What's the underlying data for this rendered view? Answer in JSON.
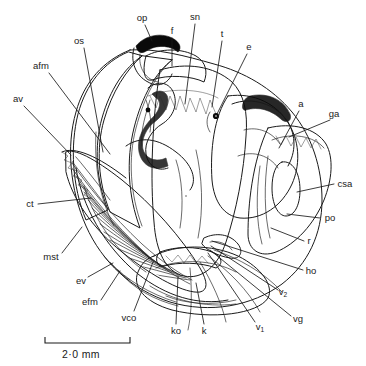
{
  "figure": {
    "background_color": "#ffffff",
    "ink_color": "#1a1a1a",
    "width": 366,
    "height": 366
  },
  "scale_bar": {
    "label": "2·0 mm",
    "x_start": 45,
    "x_end": 130,
    "y": 343,
    "tick_height": 6,
    "text_x": 62,
    "text_y": 358
  },
  "labels": [
    {
      "id": "op",
      "text": "op",
      "x": 142,
      "y": 18,
      "anchor": "middle",
      "leader": "M 145 25 L 152 41"
    },
    {
      "id": "f",
      "text": "f",
      "x": 172,
      "y": 31,
      "anchor": "middle",
      "leader": "M 172 38 L 172 66"
    },
    {
      "id": "sn",
      "text": "sn",
      "x": 195,
      "y": 17,
      "anchor": "middle",
      "leader": "M 195 24 L 185 104"
    },
    {
      "id": "t",
      "text": "t",
      "x": 222,
      "y": 34,
      "anchor": "middle",
      "leader": "M 222 41 L 212 107"
    },
    {
      "id": "e",
      "text": "e",
      "x": 249,
      "y": 47,
      "anchor": "middle",
      "leader": "M 247 54 L 217 114"
    },
    {
      "id": "os",
      "text": "os",
      "x": 79,
      "y": 41,
      "anchor": "middle",
      "leader": "M 84 48 L 103 152"
    },
    {
      "id": "afm",
      "text": "afm",
      "x": 41,
      "y": 66,
      "anchor": "middle",
      "leader": "M 49 73 L 110 154"
    },
    {
      "id": "av",
      "text": "av",
      "x": 18,
      "y": 99,
      "anchor": "middle",
      "leader": "M 24 106 L 71 155"
    },
    {
      "id": "a",
      "text": "a",
      "x": 301,
      "y": 104,
      "anchor": "middle",
      "leader": "M 299 111 L 279 148"
    },
    {
      "id": "ga",
      "text": "ga",
      "x": 334,
      "y": 114,
      "anchor": "middle",
      "leader": "M 330 120 L 289 137"
    },
    {
      "id": "csa",
      "text": "csa",
      "x": 345,
      "y": 184,
      "anchor": "middle",
      "leader": "M 334 184 L 297 192"
    },
    {
      "id": "po",
      "text": "po",
      "x": 330,
      "y": 218,
      "anchor": "middle",
      "leader": "M 320 218 L 287 214"
    },
    {
      "id": "r",
      "text": "r",
      "x": 309,
      "y": 241,
      "anchor": "middle",
      "leader": "M 304 241 L 271 228"
    },
    {
      "id": "ho",
      "text": "ho",
      "x": 311,
      "y": 271,
      "anchor": "middle",
      "leader": "M 303 270 L 212 241"
    },
    {
      "id": "v2",
      "text": "v",
      "sub": "2",
      "x": 283,
      "y": 292,
      "anchor": "middle",
      "leader": "M 278 290 L 211 246"
    },
    {
      "id": "vg",
      "text": "vg",
      "x": 298,
      "y": 319,
      "anchor": "middle",
      "leader": "M 291 316 L 210 250"
    },
    {
      "id": "v1",
      "text": "v",
      "sub": "1",
      "x": 260,
      "y": 327,
      "anchor": "middle",
      "leader": "M 255 322 L 208 253"
    },
    {
      "id": "k",
      "text": "k",
      "x": 204,
      "y": 331,
      "anchor": "middle",
      "leader": "M 204 324 L 196 283"
    },
    {
      "id": "ko",
      "text": "ko",
      "x": 176,
      "y": 331,
      "anchor": "middle",
      "leader": "M 176 324 L 178 276"
    },
    {
      "id": "vco",
      "text": "vco",
      "x": 129,
      "y": 318,
      "anchor": "middle",
      "leader": "M 134 311 L 153 262"
    },
    {
      "id": "efm",
      "text": "efm",
      "x": 90,
      "y": 302,
      "anchor": "middle",
      "leader": "M 101 300 L 120 271"
    },
    {
      "id": "ev",
      "text": "ev",
      "x": 81,
      "y": 281,
      "anchor": "middle",
      "leader": "M 88 277 L 113 263"
    },
    {
      "id": "mst",
      "text": "mst",
      "x": 51,
      "y": 257,
      "anchor": "middle",
      "leader": "M 62 253 L 82 227"
    },
    {
      "id": "ct",
      "text": "ct",
      "x": 30,
      "y": 204,
      "anchor": "middle",
      "leader": "M 38 204 L 91 198"
    }
  ],
  "legend_keys": {
    "op": "operculum",
    "f": "foot",
    "sn": "snout",
    "t": "tentacle",
    "e": "eye",
    "os": "osphradium",
    "afm": "anterior foot muscle",
    "av": "afferent vessel",
    "a": "anus",
    "ga": "gill axis",
    "csa": "ctenidial sinus anterior",
    "po": "pallial oviduct",
    "r": "rectum",
    "ho": "head opening",
    "v2": "vessel 2",
    "vg": "visceral ganglion",
    "v1": "vessel 1",
    "k": "kidney",
    "ko": "kidney opening",
    "vco": "visceral commissure",
    "efm": "efferent membrane",
    "ev": "efferent vessel",
    "mst": "mantle skirt",
    "ct": "ctenidium"
  }
}
